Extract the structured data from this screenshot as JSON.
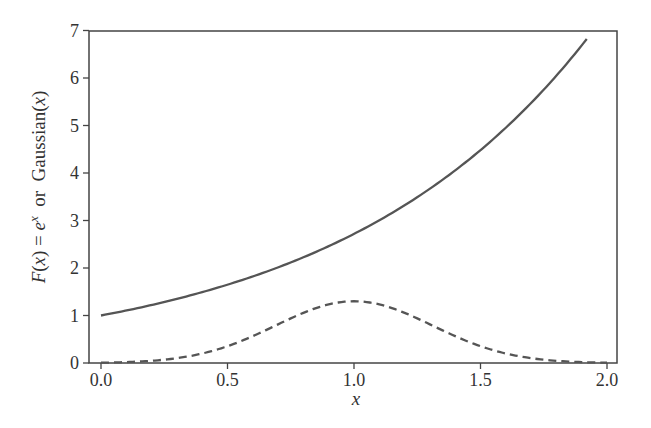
{
  "chart_data": {
    "type": "line",
    "title": "",
    "xlabel": "x",
    "ylabel": "F(x) = e^x  or  Gaussian(x)",
    "xlim": [
      -0.05,
      2.05
    ],
    "ylim": [
      0,
      7
    ],
    "grid": false,
    "legend": null,
    "xticks": [
      0.0,
      0.5,
      1.0,
      1.5,
      2.0
    ],
    "xtick_labels": [
      "0.0",
      "0.5",
      "1.0",
      "1.5",
      "2.0"
    ],
    "yticks": [
      0,
      1,
      2,
      3,
      4,
      5,
      6,
      7
    ],
    "ytick_labels": [
      "0",
      "1",
      "2",
      "3",
      "4",
      "5",
      "6",
      "7"
    ],
    "series": [
      {
        "name": "e^x",
        "style": "solid",
        "color": "#555555",
        "x": [
          0.0,
          0.2,
          0.4,
          0.6,
          0.8,
          1.0,
          1.2,
          1.4,
          1.6,
          1.8,
          1.92
        ],
        "y": [
          1.0,
          1.22,
          1.49,
          1.82,
          2.23,
          2.72,
          3.32,
          4.06,
          4.95,
          6.05,
          6.82
        ]
      },
      {
        "name": "Gaussian",
        "style": "dashed",
        "color": "#555555",
        "x": [
          0.0,
          0.2,
          0.4,
          0.5,
          0.6,
          0.8,
          1.0,
          1.2,
          1.4,
          1.5,
          1.6,
          1.8,
          2.0
        ],
        "y": [
          0.01,
          0.05,
          0.21,
          0.36,
          0.57,
          1.06,
          1.3,
          1.06,
          0.57,
          0.36,
          0.21,
          0.05,
          0.01
        ],
        "peak": 1.3,
        "center": 1.0,
        "sigma": 0.31
      }
    ]
  },
  "labels": {
    "xlabel": "x",
    "ylabel_F": "F",
    "ylabel_x1": "(",
    "ylabel_x2": "x",
    "ylabel_x3": ") = ",
    "ylabel_e": "e",
    "ylabel_exp": "x",
    "ylabel_or": "  or  ",
    "ylabel_gauss": "Gaussian(",
    "ylabel_gx": "x",
    "ylabel_close": ")"
  }
}
